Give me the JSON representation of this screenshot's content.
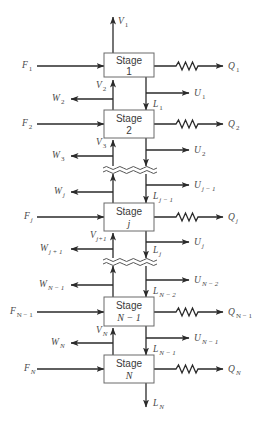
{
  "diagram": {
    "colors": {
      "line": "#2a2a2a",
      "box_border": "#6a6a6a",
      "text": "#4a4a4a",
      "background": "#ffffff"
    },
    "stages": [
      {
        "id": "1",
        "label": "Stage",
        "number": "1",
        "feed": {
          "sym": "F",
          "sub": "1"
        },
        "heat": {
          "sym": "Q",
          "sub": "1"
        }
      },
      {
        "id": "2",
        "label": "Stage",
        "number": "2",
        "feed": {
          "sym": "F",
          "sub": "2"
        },
        "heat": {
          "sym": "Q",
          "sub": "2"
        }
      },
      {
        "id": "j",
        "label": "Stage",
        "number": "j",
        "feed": {
          "sym": "F",
          "sub": "j"
        },
        "heat": {
          "sym": "Q",
          "sub": "j"
        }
      },
      {
        "id": "N-1",
        "label": "Stage",
        "number": "N − 1",
        "feed": {
          "sym": "F",
          "sub": "N − 1"
        },
        "heat": {
          "sym": "Q",
          "sub": "N − 1"
        }
      },
      {
        "id": "N",
        "label": "Stage",
        "number": "N",
        "feed": {
          "sym": "F",
          "sub": "N"
        },
        "heat": {
          "sym": "Q",
          "sub": "N"
        }
      }
    ],
    "vapor_streams": [
      {
        "sym": "V",
        "sub": "1"
      },
      {
        "sym": "V",
        "sub": "2"
      },
      {
        "sym": "V",
        "sub": "3"
      },
      {
        "sym": "V",
        "sub": "j+1"
      },
      {
        "sym": "V",
        "sub": "N"
      }
    ],
    "liquid_streams": [
      {
        "sym": "L",
        "sub": "1"
      },
      {
        "sym": "L",
        "sub": "j − 1"
      },
      {
        "sym": "L",
        "sub": "j"
      },
      {
        "sym": "L",
        "sub": "N − 2"
      },
      {
        "sym": "L",
        "sub": "N − 1"
      },
      {
        "sym": "L",
        "sub": "N"
      }
    ],
    "vapor_sidestreams": [
      {
        "sym": "W",
        "sub": "2"
      },
      {
        "sym": "W",
        "sub": "3"
      },
      {
        "sym": "W",
        "sub": "j"
      },
      {
        "sym": "W",
        "sub": "j + 1"
      },
      {
        "sym": "W",
        "sub": "N − 1"
      },
      {
        "sym": "W",
        "sub": "N"
      }
    ],
    "liquid_sidestreams": [
      {
        "sym": "U",
        "sub": "1"
      },
      {
        "sym": "U",
        "sub": "2"
      },
      {
        "sym": "U",
        "sub": "j − 1"
      },
      {
        "sym": "U",
        "sub": "j"
      },
      {
        "sym": "U",
        "sub": "N − 2"
      },
      {
        "sym": "U",
        "sub": "N − 1"
      }
    ],
    "icons": {
      "heat_exchange": "zigzag-resistor-icon",
      "section_break": "wavy-break-icon",
      "flow_arrow": "arrowhead-icon"
    }
  }
}
